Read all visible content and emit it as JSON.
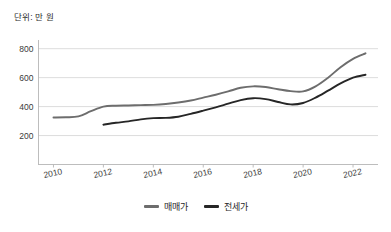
{
  "unit_label": "단위: 만 원",
  "legend": {
    "items": [
      {
        "label": "매매가",
        "color": "#6d6d6d"
      },
      {
        "label": "전세가",
        "color": "#262626"
      }
    ]
  },
  "axis": {
    "y_ticks": [
      "200",
      "400",
      "600",
      "800"
    ],
    "x_ticks": [
      "2010",
      "2012",
      "2014",
      "2016",
      "2018",
      "2020",
      "2022"
    ]
  },
  "chart_data": {
    "type": "line",
    "title": "",
    "subtitle": "",
    "xlabel": "",
    "ylabel": "단위: 만 원",
    "xlim": [
      2009.4,
      2023.0
    ],
    "ylim": [
      0,
      860
    ],
    "ytick_values": [
      200,
      400,
      600,
      800
    ],
    "xtick_values": [
      2010,
      2012,
      2014,
      2016,
      2018,
      2020,
      2022
    ],
    "grid": true,
    "legend_position": "bottom-center",
    "series": [
      {
        "name": "매매가",
        "color": "#6d6d6d",
        "x": [
          2010.0,
          2010.5,
          2011.0,
          2011.5,
          2012.0,
          2012.5,
          2013.0,
          2013.5,
          2014.0,
          2014.5,
          2015.0,
          2015.5,
          2016.0,
          2016.5,
          2017.0,
          2017.5,
          2018.0,
          2018.5,
          2019.0,
          2019.5,
          2020.0,
          2020.5,
          2021.0,
          2021.5,
          2022.0,
          2022.5
        ],
        "values": [
          325,
          326,
          332,
          368,
          400,
          406,
          408,
          410,
          412,
          418,
          428,
          442,
          462,
          482,
          505,
          530,
          540,
          535,
          520,
          507,
          505,
          540,
          600,
          672,
          730,
          768
        ]
      },
      {
        "name": "전세가",
        "color": "#262626",
        "x": [
          2012.0,
          2012.5,
          2013.0,
          2013.5,
          2014.0,
          2014.5,
          2015.0,
          2015.5,
          2016.0,
          2016.5,
          2017.0,
          2017.5,
          2018.0,
          2018.5,
          2019.0,
          2019.5,
          2020.0,
          2020.5,
          2021.0,
          2021.5,
          2022.0,
          2022.5
        ],
        "values": [
          275,
          288,
          298,
          312,
          320,
          322,
          330,
          350,
          372,
          395,
          420,
          445,
          458,
          452,
          432,
          415,
          425,
          462,
          510,
          560,
          600,
          620
        ]
      }
    ]
  }
}
